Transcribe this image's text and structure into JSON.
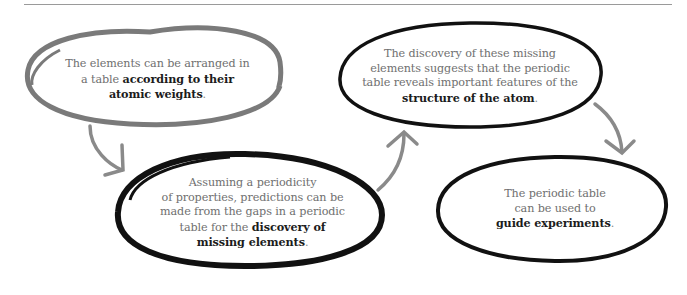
{
  "diagram": {
    "type": "flow",
    "nodes": [
      {
        "id": "n1",
        "lines": [
          "The elements can be arranged in",
          "a table "
        ],
        "bold": [
          "according to their",
          "atomic weights"
        ],
        "end": ".",
        "outline_color": "#777777"
      },
      {
        "id": "n2",
        "lines": [
          "Assuming a periodicity",
          "of properties, predictions can be",
          "made from the gaps in a periodic",
          "table for the "
        ],
        "bold": [
          "discovery of",
          "missing elements"
        ],
        "end": ".",
        "outline_color": "#111111"
      },
      {
        "id": "n3",
        "lines": [
          "The discovery of these missing",
          "elements suggests that the periodic",
          "table reveals important features of the"
        ],
        "bold": [
          "structure of the atom"
        ],
        "end": ".",
        "outline_color": "#111111"
      },
      {
        "id": "n4",
        "lines": [
          "The periodic table",
          "can be used to"
        ],
        "bold": [
          "guide experiments"
        ],
        "end": ".",
        "outline_color": "#111111"
      }
    ],
    "edges": [
      {
        "from": "n1",
        "to": "n2"
      },
      {
        "from": "n2",
        "to": "n3"
      },
      {
        "from": "n3",
        "to": "n4"
      }
    ],
    "arrow_color": "#8a8a8a"
  }
}
